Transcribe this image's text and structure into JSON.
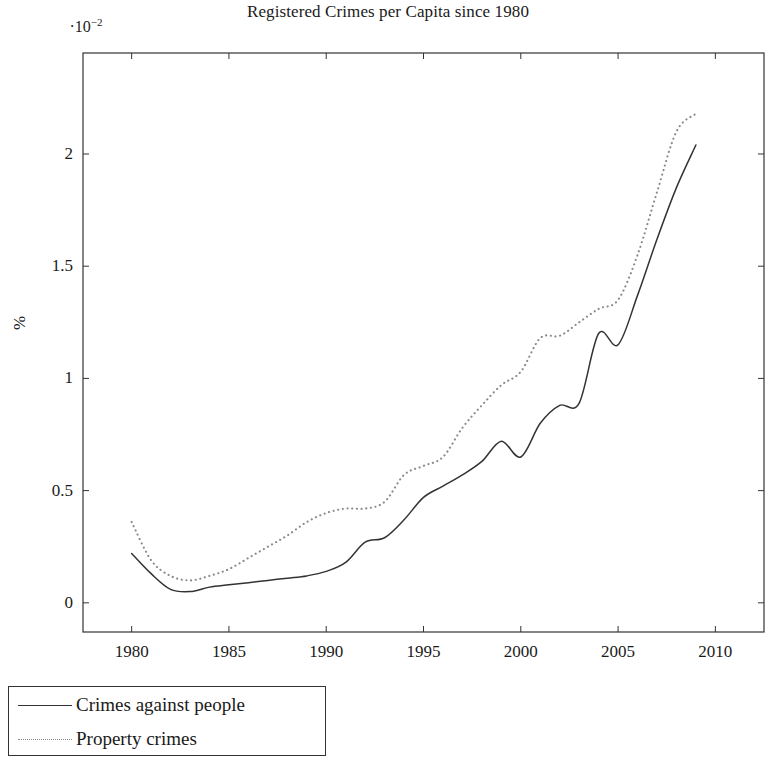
{
  "chart_data": {
    "type": "line",
    "title": "Registered Crimes per Capita since 1980",
    "xlabel": "",
    "ylabel": "%",
    "y_multiplier": "·10",
    "y_multiplier_exponent": "−2",
    "xlim": [
      1977.5,
      2012.5
    ],
    "ylim": [
      -0.13,
      2.45
    ],
    "xticks": [
      1980,
      1985,
      1990,
      1995,
      2000,
      2005,
      2010
    ],
    "yticks": [
      0,
      0.5,
      1,
      1.5,
      2
    ],
    "ytick_labels": [
      "0",
      "0.5",
      "1",
      "1.5",
      "2"
    ],
    "xtick_labels": [
      "1980",
      "1985",
      "1990",
      "1995",
      "2000",
      "2005",
      "2010"
    ],
    "grid": false,
    "legend_position": "below-left",
    "x": [
      1980,
      1981,
      1982,
      1983,
      1984,
      1985,
      1986,
      1987,
      1988,
      1989,
      1990,
      1991,
      1992,
      1993,
      1994,
      1995,
      1996,
      1997,
      1998,
      1999,
      2000,
      2001,
      2002,
      2003,
      2004,
      2005,
      2006,
      2007,
      2008,
      2009
    ],
    "series": [
      {
        "name": "Crimes against people",
        "style": "solid",
        "color": "#333333",
        "values": [
          0.22,
          0.13,
          0.06,
          0.05,
          0.07,
          0.08,
          0.09,
          0.1,
          0.11,
          0.12,
          0.14,
          0.18,
          0.27,
          0.29,
          0.37,
          0.47,
          0.52,
          0.57,
          0.63,
          0.72,
          0.65,
          0.8,
          0.88,
          0.89,
          1.2,
          1.15,
          1.37,
          1.62,
          1.85,
          2.04
        ]
      },
      {
        "name": "Property crimes",
        "style": "dotted",
        "color": "#8a8a8a",
        "values": [
          0.36,
          0.19,
          0.12,
          0.1,
          0.12,
          0.15,
          0.2,
          0.25,
          0.3,
          0.36,
          0.4,
          0.42,
          0.42,
          0.45,
          0.57,
          0.61,
          0.65,
          0.78,
          0.88,
          0.97,
          1.03,
          1.18,
          1.19,
          1.25,
          1.31,
          1.35,
          1.55,
          1.83,
          2.1,
          2.18
        ]
      }
    ]
  },
  "legend": {
    "items": [
      {
        "label": "Crimes against people",
        "style": "solid"
      },
      {
        "label": "Property crimes",
        "style": "dotted"
      }
    ]
  }
}
